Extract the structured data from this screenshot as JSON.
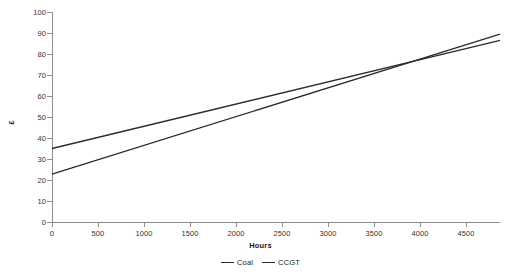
{
  "chart_data": {
    "type": "line",
    "title": "",
    "xlabel": "Hours",
    "ylabel": "£",
    "xlim": [
      0,
      4870
    ],
    "ylim": [
      0,
      100
    ],
    "grid": false,
    "legend_position": "bottom-center",
    "x_ticks": [
      0,
      500,
      1000,
      1500,
      2000,
      2500,
      3000,
      3500,
      4000,
      4500
    ],
    "x_tick_labels": [
      "0",
      "500",
      "1000",
      "1500",
      "2000",
      "2500",
      "3000",
      "3500",
      "4000",
      "4500"
    ],
    "y_ticks": [
      0,
      10,
      20,
      30,
      40,
      50,
      60,
      70,
      80,
      90,
      100
    ],
    "y_tick_labels": [
      "0",
      "10",
      "20",
      "30",
      "40",
      "50",
      "60",
      "70",
      "80",
      "90",
      "100"
    ],
    "series": [
      {
        "name": "Coal",
        "color": "#2b2b2b",
        "x": [
          0,
          4870
        ],
        "values": [
          35,
          86.5
        ]
      },
      {
        "name": "CCGT",
        "color": "#2b2b2b",
        "x": [
          0,
          4870
        ],
        "values": [
          22.8,
          89.5
        ]
      }
    ],
    "annotations": [
      {
        "text": "crossover",
        "x": 3980,
        "y": 77
      }
    ]
  },
  "legend": {
    "items": [
      {
        "label": "Coal"
      },
      {
        "label": "CCGT"
      }
    ]
  },
  "colors": {
    "axis": "#8d8d8d",
    "text": "#1a1a1a",
    "tick_text": "#333333",
    "series_line": "#2b2b2b",
    "background": "#ffffff"
  }
}
